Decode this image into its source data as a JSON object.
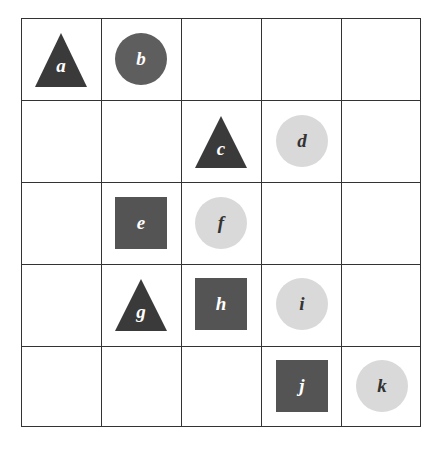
{
  "grid": {
    "rows": 5,
    "cols": 5
  },
  "colors": {
    "dark_triangle": "#3a3a3a",
    "dark_square": "#545454",
    "dark_circle": "#5e5e5e",
    "light_circle": "#d9d9d9",
    "lines": "#333333"
  },
  "shapes": [
    {
      "label": "a",
      "shape": "triangle",
      "row": 0,
      "col": 0,
      "fill": "dark"
    },
    {
      "label": "b",
      "shape": "circle",
      "row": 0,
      "col": 1,
      "fill": "dark"
    },
    {
      "label": "c",
      "shape": "triangle",
      "row": 1,
      "col": 2,
      "fill": "dark"
    },
    {
      "label": "d",
      "shape": "circle",
      "row": 1,
      "col": 3,
      "fill": "light"
    },
    {
      "label": "e",
      "shape": "square",
      "row": 2,
      "col": 1,
      "fill": "dark"
    },
    {
      "label": "f",
      "shape": "circle",
      "row": 2,
      "col": 2,
      "fill": "light"
    },
    {
      "label": "g",
      "shape": "triangle",
      "row": 3,
      "col": 1,
      "fill": "dark"
    },
    {
      "label": "h",
      "shape": "square",
      "row": 3,
      "col": 2,
      "fill": "dark"
    },
    {
      "label": "i",
      "shape": "circle",
      "row": 3,
      "col": 3,
      "fill": "light"
    },
    {
      "label": "j",
      "shape": "square",
      "row": 4,
      "col": 3,
      "fill": "dark"
    },
    {
      "label": "k",
      "shape": "circle",
      "row": 4,
      "col": 4,
      "fill": "light"
    }
  ]
}
